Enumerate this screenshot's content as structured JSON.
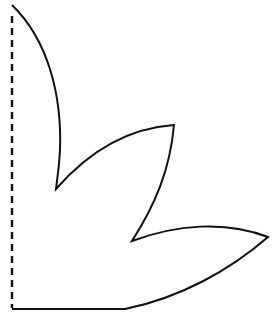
{
  "diagram": {
    "type": "cut-out template shape (leaf / petal outline with fold line)",
    "background": "#ffffff",
    "stroke_color": "#111111",
    "fold_line": {
      "style": "dashed",
      "x": 12,
      "y_start": 16,
      "y_end": 308
    },
    "outline": {
      "style": "solid",
      "path": "M 12 5 C 48 40, 62 95, 60 150 C 59 170, 57 180, 56 189 C 90 150, 130 128, 174 125 C 170 170, 155 205, 132 241 C 175 225, 225 220, 268 237 C 230 270, 180 298, 125 309 L 12 309"
    }
  }
}
